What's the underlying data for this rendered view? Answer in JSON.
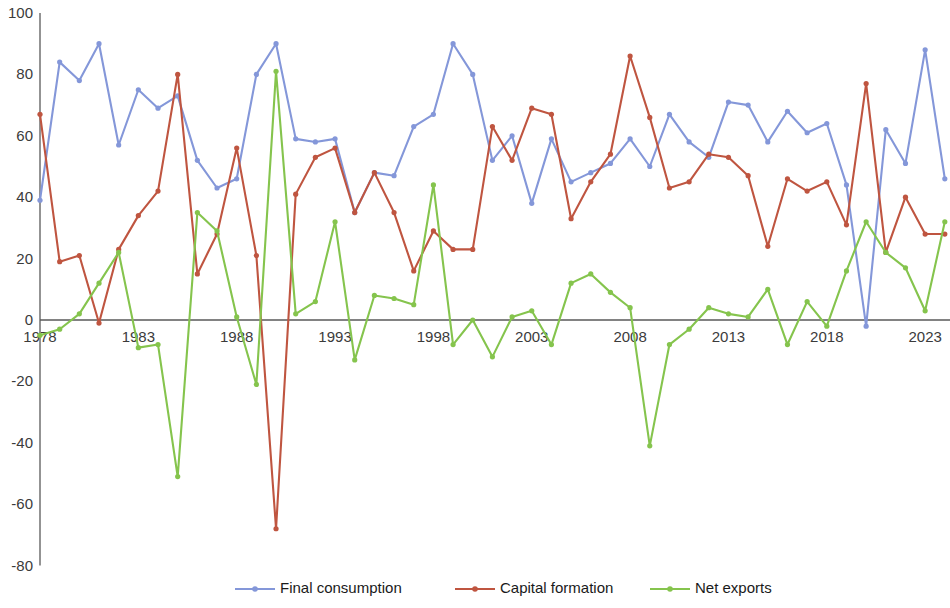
{
  "chart_data": {
    "type": "line",
    "title": "",
    "subtitle": "",
    "xlabel": "",
    "ylabel": "",
    "ylim": [
      -80,
      100
    ],
    "ytick_values": [
      100,
      80,
      60,
      40,
      20,
      0,
      -20,
      -40,
      -60,
      -80
    ],
    "ytick_labels": [
      "100",
      "80",
      "60",
      "40",
      "20",
      "0",
      "-20",
      "-40",
      "-60",
      "-80"
    ],
    "xlim": [
      1978,
      2024
    ],
    "xtick_values": [
      1978,
      1983,
      1988,
      1993,
      1998,
      2003,
      2008,
      2013,
      2018,
      2023
    ],
    "xtick_labels": [
      "1978",
      "1983",
      "1988",
      "1993",
      "1998",
      "2003",
      "2008",
      "2013",
      "2018",
      "2023"
    ],
    "grid": false,
    "legend_position": "bottom",
    "x": [
      1978,
      1979,
      1980,
      1981,
      1982,
      1983,
      1984,
      1985,
      1986,
      1987,
      1988,
      1989,
      1990,
      1991,
      1992,
      1993,
      1994,
      1995,
      1996,
      1997,
      1998,
      1999,
      2000,
      2001,
      2002,
      2003,
      2004,
      2005,
      2006,
      2007,
      2008,
      2009,
      2010,
      2011,
      2012,
      2013,
      2014,
      2015,
      2016,
      2017,
      2018,
      2019,
      2020,
      2021,
      2022,
      2023,
      2024
    ],
    "series": [
      {
        "name": "Final consumption",
        "color": "#8497d9",
        "marker": "circle",
        "values": [
          39,
          84,
          78,
          90,
          57,
          75,
          69,
          73,
          52,
          43,
          46,
          80,
          90,
          59,
          58,
          59,
          35,
          48,
          47,
          63,
          67,
          90,
          80,
          52,
          60,
          38,
          59,
          45,
          48,
          51,
          59,
          50,
          67,
          58,
          53,
          71,
          70,
          58,
          68,
          61,
          64,
          44,
          -2,
          62,
          51,
          88,
          46
        ]
      },
      {
        "name": "Capital formation",
        "color": "#bf5540",
        "marker": "circle",
        "values": [
          67,
          19,
          21,
          -1,
          23,
          34,
          42,
          80,
          15,
          28,
          56,
          21,
          -68,
          41,
          53,
          56,
          35,
          48,
          35,
          16,
          29,
          23,
          23,
          63,
          52,
          69,
          67,
          33,
          45,
          54,
          86,
          66,
          43,
          45,
          54,
          53,
          47,
          24,
          46,
          42,
          45,
          31,
          77,
          22,
          40,
          28,
          28
        ]
      },
      {
        "name": "Net exports",
        "color": "#85c44d",
        "marker": "circle",
        "values": [
          -5,
          -3,
          2,
          12,
          22,
          -9,
          -8,
          -51,
          35,
          29,
          1,
          -21,
          81,
          2,
          6,
          32,
          -13,
          8,
          7,
          5,
          44,
          -8,
          0,
          -12,
          1,
          3,
          -8,
          12,
          15,
          9,
          4,
          -41,
          -8,
          -3,
          4,
          2,
          1,
          10,
          -8,
          6,
          -2,
          16,
          32,
          22,
          17,
          3,
          32
        ]
      }
    ]
  },
  "legend": {
    "entries": [
      {
        "label": "Final consumption",
        "color": "#8497d9"
      },
      {
        "label": "Capital formation",
        "color": "#bf5540"
      },
      {
        "label": "Net exports",
        "color": "#85c44d"
      }
    ]
  },
  "axes": {
    "zero_line_color": "#595959",
    "axis_color": "#595959"
  }
}
